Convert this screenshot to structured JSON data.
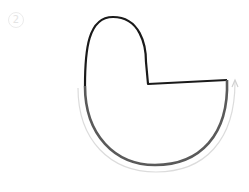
{
  "step_label": "2",
  "shape": {
    "outline_color": "#1a1a1a",
    "highlight_color": "#5a5a5a",
    "arrow_color": "#d8d8d8"
  }
}
